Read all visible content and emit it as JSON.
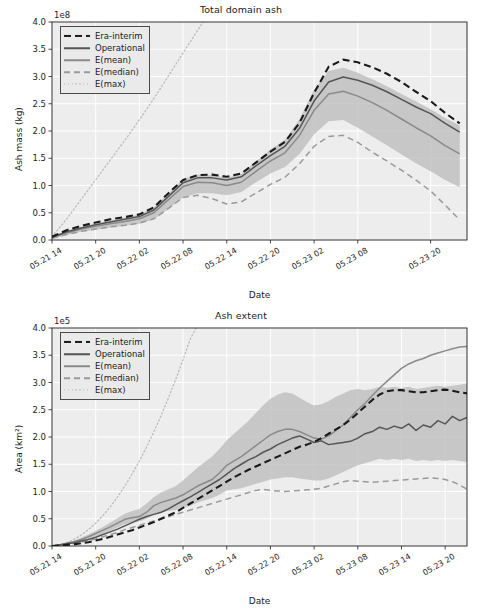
{
  "figure": {
    "width": 482,
    "height": 611,
    "background": "#ffffff",
    "plot_background": "#ededed",
    "grid_color": "#ffffff"
  },
  "colors": {
    "era_interim": "#1a1a1a",
    "operational": "#555555",
    "e_mean": "#8a8a8a",
    "e_median": "#9a9a9a",
    "e_max": "#b8b8b8",
    "band": "#b9b9b9",
    "band_outer": "#d2d2d2",
    "text": "#1c1c1c",
    "axis": "#1c1c1c"
  },
  "legend": {
    "items": [
      {
        "label": "Era-interim",
        "style": "dashed-thick",
        "color": "#1a1a1a"
      },
      {
        "label": "Operational",
        "style": "solid",
        "color": "#555555"
      },
      {
        "label": "E(mean)",
        "style": "solid",
        "color": "#8a8a8a"
      },
      {
        "label": "E(median)",
        "style": "dashed",
        "color": "#9a9a9a"
      },
      {
        "label": "E(max)",
        "style": "dotted",
        "color": "#b8b8b8"
      }
    ]
  },
  "chart_data": [
    {
      "id": "total-domain-ash",
      "type": "line",
      "title": "Total domain ash",
      "xlabel": "Date",
      "ylabel": "Ash mass (kg)",
      "y_offset_text": "1e8",
      "y_scale_exponent": 8,
      "ylim": [
        0.0,
        4.0
      ],
      "yticks": [
        "0.0",
        "0.5",
        "1.0",
        "1.5",
        "2.0",
        "2.5",
        "3.0",
        "3.5",
        "4.0"
      ],
      "ytick_values": [
        0.0,
        0.5,
        1.0,
        1.5,
        2.0,
        2.5,
        3.0,
        3.5,
        4.0
      ],
      "grid": true,
      "legend_position": "upper left",
      "xticks": [
        "05.21 14",
        "05.21 20",
        "05.22 02",
        "05.22 08",
        "05.22 14",
        "05.22 20",
        "05.23 02",
        "05.23 08",
        "05.23 20"
      ],
      "xtick_positions": [
        0,
        6,
        12,
        18,
        24,
        30,
        36,
        42,
        52
      ],
      "x": [
        0,
        2,
        4,
        6,
        8,
        10,
        12,
        14,
        16,
        18,
        20,
        22,
        24,
        26,
        28,
        30,
        32,
        34,
        36,
        38,
        40,
        42,
        44,
        46,
        48,
        50,
        52,
        54,
        56
      ],
      "xlim": [
        0,
        57
      ],
      "series": [
        {
          "name": "Era-interim",
          "style": "dashed-thick",
          "values": [
            0.06,
            0.18,
            0.26,
            0.32,
            0.38,
            0.42,
            0.47,
            0.6,
            0.86,
            1.1,
            1.19,
            1.2,
            1.16,
            1.22,
            1.42,
            1.62,
            1.8,
            2.15,
            2.7,
            3.18,
            3.31,
            3.26,
            3.17,
            3.05,
            2.9,
            2.72,
            2.55,
            2.33,
            2.14
          ]
        },
        {
          "name": "Operational",
          "style": "solid",
          "values": [
            0.05,
            0.15,
            0.22,
            0.28,
            0.33,
            0.38,
            0.43,
            0.55,
            0.8,
            1.05,
            1.14,
            1.14,
            1.1,
            1.16,
            1.36,
            1.55,
            1.72,
            2.05,
            2.55,
            2.9,
            2.99,
            2.93,
            2.84,
            2.72,
            2.58,
            2.44,
            2.32,
            2.14,
            1.98
          ]
        },
        {
          "name": "E(mean)",
          "style": "solid",
          "values": [
            0.04,
            0.13,
            0.2,
            0.25,
            0.3,
            0.34,
            0.39,
            0.5,
            0.74,
            0.98,
            1.06,
            1.05,
            1.0,
            1.06,
            1.26,
            1.45,
            1.6,
            1.92,
            2.38,
            2.68,
            2.73,
            2.64,
            2.52,
            2.38,
            2.22,
            2.06,
            1.91,
            1.73,
            1.58
          ]
        },
        {
          "name": "E(median)",
          "style": "dashed",
          "values": [
            0.03,
            0.1,
            0.16,
            0.2,
            0.24,
            0.27,
            0.31,
            0.39,
            0.58,
            0.78,
            0.82,
            0.76,
            0.66,
            0.7,
            0.86,
            1.02,
            1.15,
            1.4,
            1.72,
            1.9,
            1.92,
            1.79,
            1.61,
            1.45,
            1.28,
            1.1,
            0.9,
            0.64,
            0.37
          ]
        },
        {
          "name": "E(max)",
          "style": "dotted",
          "values": [
            0.06,
            0.4,
            0.78,
            1.16,
            1.54,
            1.92,
            2.32,
            2.74,
            3.18,
            3.62,
            4.05
          ]
        }
      ],
      "band": {
        "name": "E(mean) spread",
        "upper": [
          0.05,
          0.16,
          0.24,
          0.3,
          0.36,
          0.41,
          0.47,
          0.6,
          0.86,
          1.12,
          1.2,
          1.19,
          1.14,
          1.21,
          1.44,
          1.66,
          1.84,
          2.22,
          2.76,
          3.1,
          3.16,
          3.07,
          2.95,
          2.82,
          2.68,
          2.54,
          2.4,
          2.24,
          2.1
        ],
        "lower": [
          0.02,
          0.09,
          0.15,
          0.19,
          0.23,
          0.26,
          0.3,
          0.38,
          0.57,
          0.78,
          0.86,
          0.86,
          0.82,
          0.88,
          1.06,
          1.22,
          1.34,
          1.58,
          1.94,
          2.18,
          2.2,
          2.06,
          1.9,
          1.74,
          1.57,
          1.41,
          1.26,
          1.1,
          0.97
        ]
      }
    },
    {
      "id": "ash-extent",
      "type": "line",
      "title": "Ash extent",
      "xlabel": "Date",
      "ylabel": "Area (km²)",
      "y_offset_text": "1e5",
      "y_scale_exponent": 5,
      "ylim": [
        0.0,
        4.0
      ],
      "yticks": [
        "0.0",
        "0.5",
        "1.0",
        "1.5",
        "2.0",
        "2.5",
        "3.0",
        "3.5",
        "4.0"
      ],
      "ytick_values": [
        0.0,
        0.5,
        1.0,
        1.5,
        2.0,
        2.5,
        3.0,
        3.5,
        4.0
      ],
      "grid": true,
      "legend_position": "upper left",
      "xticks": [
        "05.21 14",
        "05.21 20",
        "05.22 02",
        "05.22 08",
        "05.22 14",
        "05.22 20",
        "05.23 02",
        "05.23 08",
        "05.23 14",
        "05.23 20"
      ],
      "xtick_positions": [
        0,
        6,
        12,
        18,
        24,
        30,
        36,
        42,
        48,
        54
      ],
      "x": [
        0,
        1,
        2,
        3,
        4,
        5,
        6,
        7,
        8,
        9,
        10,
        11,
        12,
        13,
        14,
        15,
        16,
        17,
        18,
        19,
        20,
        21,
        22,
        23,
        24,
        25,
        26,
        27,
        28,
        29,
        30,
        31,
        32,
        33,
        34,
        35,
        36,
        37,
        38,
        39,
        40,
        41,
        42,
        43,
        44,
        45,
        46,
        47,
        48,
        49,
        50,
        51,
        52,
        53,
        54,
        55,
        56,
        57
      ],
      "xlim": [
        0,
        57
      ],
      "series": [
        {
          "name": "Era-interim",
          "style": "dashed-thick",
          "values": [
            0.0,
            0.01,
            0.02,
            0.03,
            0.05,
            0.07,
            0.1,
            0.13,
            0.17,
            0.21,
            0.25,
            0.29,
            0.34,
            0.39,
            0.44,
            0.5,
            0.56,
            0.62,
            0.7,
            0.78,
            0.86,
            0.94,
            1.02,
            1.1,
            1.18,
            1.26,
            1.33,
            1.4,
            1.46,
            1.52,
            1.58,
            1.64,
            1.7,
            1.76,
            1.82,
            1.86,
            1.91,
            1.98,
            2.06,
            2.14,
            2.22,
            2.32,
            2.44,
            2.56,
            2.68,
            2.78,
            2.84,
            2.86,
            2.86,
            2.84,
            2.82,
            2.82,
            2.84,
            2.86,
            2.87,
            2.85,
            2.82,
            2.8
          ]
        },
        {
          "name": "Operational",
          "style": "solid",
          "values": [
            0.0,
            0.02,
            0.04,
            0.06,
            0.09,
            0.12,
            0.16,
            0.21,
            0.26,
            0.31,
            0.37,
            0.43,
            0.49,
            0.54,
            0.58,
            0.62,
            0.68,
            0.76,
            0.83,
            0.9,
            0.98,
            1.06,
            1.14,
            1.22,
            1.32,
            1.42,
            1.5,
            1.58,
            1.64,
            1.72,
            1.78,
            1.86,
            1.92,
            1.98,
            2.02,
            1.96,
            1.9,
            1.93,
            1.86,
            1.88,
            1.9,
            1.92,
            1.98,
            2.06,
            2.1,
            2.18,
            2.14,
            2.2,
            2.16,
            2.24,
            2.12,
            2.22,
            2.18,
            2.3,
            2.24,
            2.38,
            2.3,
            2.36
          ]
        },
        {
          "name": "E(mean)",
          "style": "solid",
          "values": [
            0.0,
            0.02,
            0.05,
            0.08,
            0.12,
            0.17,
            0.23,
            0.29,
            0.35,
            0.42,
            0.49,
            0.52,
            0.54,
            0.62,
            0.74,
            0.8,
            0.84,
            0.88,
            0.94,
            1.02,
            1.1,
            1.16,
            1.22,
            1.34,
            1.48,
            1.56,
            1.64,
            1.74,
            1.84,
            1.94,
            2.04,
            2.1,
            2.14,
            2.14,
            2.1,
            2.04,
            1.98,
            1.96,
            2.02,
            2.12,
            2.22,
            2.36,
            2.5,
            2.62,
            2.76,
            2.9,
            3.02,
            3.14,
            3.26,
            3.34,
            3.4,
            3.44,
            3.5,
            3.54,
            3.58,
            3.62,
            3.65,
            3.66
          ]
        },
        {
          "name": "E(median)",
          "style": "dashed",
          "values": [
            0.0,
            0.01,
            0.03,
            0.05,
            0.07,
            0.1,
            0.13,
            0.17,
            0.21,
            0.25,
            0.3,
            0.34,
            0.38,
            0.42,
            0.46,
            0.5,
            0.54,
            0.58,
            0.62,
            0.66,
            0.7,
            0.74,
            0.78,
            0.82,
            0.86,
            0.9,
            0.94,
            0.98,
            1.02,
            1.04,
            1.02,
            1.01,
            1.0,
            1.01,
            1.02,
            1.03,
            1.04,
            1.06,
            1.1,
            1.14,
            1.18,
            1.2,
            1.19,
            1.18,
            1.17,
            1.18,
            1.19,
            1.2,
            1.21,
            1.22,
            1.23,
            1.24,
            1.25,
            1.24,
            1.22,
            1.18,
            1.12,
            1.04
          ]
        },
        {
          "name": "E(max)",
          "style": "dotted",
          "values": [
            0.0,
            0.02,
            0.06,
            0.12,
            0.2,
            0.3,
            0.42,
            0.56,
            0.72,
            0.9,
            1.1,
            1.32,
            1.56,
            1.82,
            2.1,
            2.4,
            2.72,
            3.06,
            3.42,
            3.8,
            4.05
          ]
        }
      ],
      "band": {
        "name": "E(mean) spread",
        "upper": [
          0.0,
          0.03,
          0.06,
          0.1,
          0.15,
          0.21,
          0.28,
          0.35,
          0.43,
          0.51,
          0.59,
          0.64,
          0.68,
          0.78,
          0.9,
          0.98,
          1.04,
          1.1,
          1.2,
          1.32,
          1.44,
          1.54,
          1.64,
          1.78,
          1.94,
          2.06,
          2.18,
          2.3,
          2.44,
          2.58,
          2.7,
          2.78,
          2.82,
          2.8,
          2.72,
          2.64,
          2.58,
          2.6,
          2.66,
          2.74,
          2.8,
          2.86,
          2.88,
          2.86,
          2.88,
          2.92,
          2.9,
          2.92,
          2.9,
          2.92,
          2.88,
          2.9,
          2.92,
          2.94,
          2.92,
          2.94,
          2.96,
          2.98
        ],
        "lower": [
          0.0,
          0.01,
          0.03,
          0.06,
          0.09,
          0.13,
          0.18,
          0.23,
          0.28,
          0.34,
          0.4,
          0.43,
          0.45,
          0.5,
          0.58,
          0.62,
          0.64,
          0.66,
          0.7,
          0.74,
          0.8,
          0.84,
          0.88,
          0.94,
          1.02,
          1.04,
          1.06,
          1.1,
          1.14,
          1.18,
          1.22,
          1.24,
          1.26,
          1.26,
          1.24,
          1.22,
          1.2,
          1.2,
          1.24,
          1.3,
          1.36,
          1.42,
          1.48,
          1.52,
          1.56,
          1.6,
          1.58,
          1.6,
          1.58,
          1.6,
          1.56,
          1.58,
          1.56,
          1.58,
          1.56,
          1.58,
          1.56,
          1.54
        ]
      }
    }
  ]
}
